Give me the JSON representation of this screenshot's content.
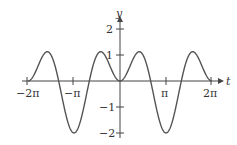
{
  "chart_data": {
    "type": "line",
    "title": "",
    "xlabel": "t",
    "ylabel": "y",
    "function": "y = cos(t) - cos(2t)",
    "xlim": [
      -6.2832,
      6.2832
    ],
    "ylim": [
      -2,
      2
    ],
    "x_ticks": [
      "-2π",
      "-π",
      "π",
      "2π"
    ],
    "y_ticks": [
      "2",
      "1",
      "-1",
      "-2"
    ],
    "grid": false,
    "series": [
      {
        "name": "y(t)",
        "x": [
          -6.283,
          -4.712,
          -3.142,
          -1.318,
          0,
          1.318,
          3.142,
          4.712,
          6.283
        ],
        "values": [
          0,
          1,
          -2,
          1.125,
          0,
          1.125,
          -2,
          1,
          0
        ]
      }
    ]
  },
  "labels": {
    "x_axis": "t",
    "y_axis": "y",
    "xt0": "−2π",
    "xt1": "−π",
    "xt2": "π",
    "xt3": "2π",
    "yt0": "2",
    "yt1": "1",
    "yt2": "−1",
    "yt3": "−2"
  }
}
